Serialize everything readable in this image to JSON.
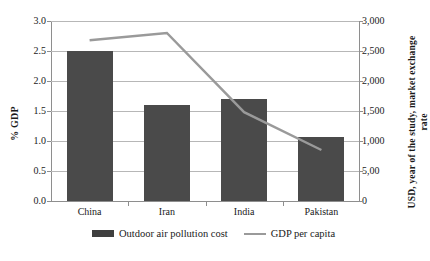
{
  "chart_data": {
    "type": "bar",
    "title": "",
    "categories": [
      "China",
      "Iran",
      "India",
      "Pakistan"
    ],
    "series": [
      {
        "name": "Outdoor air pollution cost",
        "type": "bar",
        "axis": "left",
        "values": [
          2.5,
          1.6,
          1.7,
          1.07
        ],
        "color": "#4a4a4a"
      },
      {
        "name": "GDP per capita",
        "type": "line",
        "axis": "right",
        "values": [
          2680,
          2800,
          1480,
          850
        ],
        "color": "#9a9a9a"
      }
    ],
    "xlabel": "",
    "ylabel": "% GDP",
    "ylabel_right": "USD, year of the study, market exchange rate",
    "ylim": [
      0,
      3
    ],
    "ylim_right": [
      0,
      3000
    ],
    "yticks_left": [
      "0.0",
      "0.5",
      "1.0",
      "1.5",
      "2.0",
      "2.5",
      "3.0"
    ],
    "yticks_left_values": [
      0.0,
      0.5,
      1.0,
      1.5,
      2.0,
      2.5,
      3.0
    ],
    "yticks_right": [
      "0",
      "5,00",
      "1,000",
      "1,500",
      "2,000",
      "2,500",
      "3,000"
    ],
    "yticks_right_values": [
      0,
      500,
      1000,
      1500,
      2000,
      2500,
      3000
    ],
    "grid": true,
    "legend_position": "bottom"
  },
  "legend": {
    "items": [
      {
        "label": "Outdoor air pollution cost",
        "marker": "bar-swatch-icon"
      },
      {
        "label": "GDP per capita",
        "marker": "line-swatch-icon"
      }
    ]
  },
  "colors": {
    "bar": "#4a4a4a",
    "line": "#9a9a9a",
    "grid": "#b7b7b7",
    "axis": "#8e8e8e",
    "text": "#1a1a1a",
    "background": "#ffffff"
  }
}
